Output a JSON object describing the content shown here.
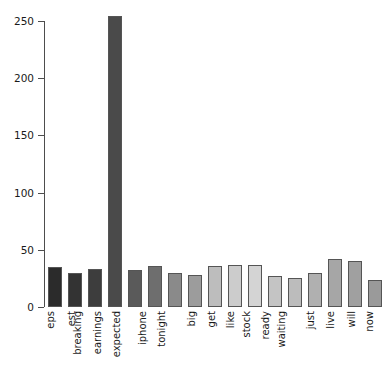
{
  "chart_data": {
    "type": "bar",
    "title": "",
    "subtitle": "",
    "xlabel": "",
    "ylabel": "",
    "ylim": [
      0,
      260
    ],
    "yticks": [
      0,
      50,
      100,
      150,
      200,
      250
    ],
    "grid": false,
    "legend": null,
    "categories": [
      "eps",
      "est",
      "breaking",
      "earnings",
      "expected",
      "iphone",
      "tonight",
      "big",
      "get",
      "like",
      "stock",
      "ready",
      "waiting",
      "just",
      "live",
      "will",
      "now"
    ],
    "values": [
      35,
      30,
      33,
      254,
      32,
      36,
      30,
      28,
      36,
      37,
      37,
      27,
      25,
      30,
      42,
      40,
      24
    ],
    "bar_colors": [
      "#2b2b2b",
      "#333333",
      "#3d3d3d",
      "#4a4a4a",
      "#5a5a5a",
      "#6e6e6e",
      "#8a8a8a",
      "#9c9c9c",
      "#bdbdbd",
      "#cccccc",
      "#d4d4d4",
      "#c4c4c4",
      "#bcbcbc",
      "#b0b0b0",
      "#a6a6a6",
      "#a0a0a0",
      "#9a9a9a"
    ],
    "bar_edge_color": "#555555",
    "axis_color": "#4d4d4d",
    "text_color": "#1a1a1a",
    "background_color": "#ffffff"
  }
}
